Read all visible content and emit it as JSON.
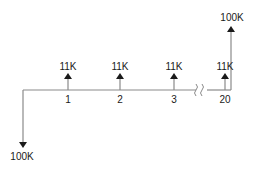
{
  "diagram": {
    "type": "cash-flow-diagram",
    "line_color": "#8a8a8a",
    "arrow_color": "#1a1a1a",
    "text_color": "#1a1a1a",
    "initial_outflow": {
      "label": "100K",
      "direction": "down",
      "period": 0
    },
    "periodic_inflows": [
      {
        "period_label": "1",
        "amount_label": "11K",
        "direction": "up"
      },
      {
        "period_label": "2",
        "amount_label": "11K",
        "direction": "up"
      },
      {
        "period_label": "3",
        "amount_label": "11K",
        "direction": "up"
      },
      {
        "period_label": "20",
        "amount_label": "11K",
        "direction": "up"
      }
    ],
    "final_inflow": {
      "label": "100K",
      "direction": "up",
      "period": 20
    },
    "break_symbol": "//"
  }
}
